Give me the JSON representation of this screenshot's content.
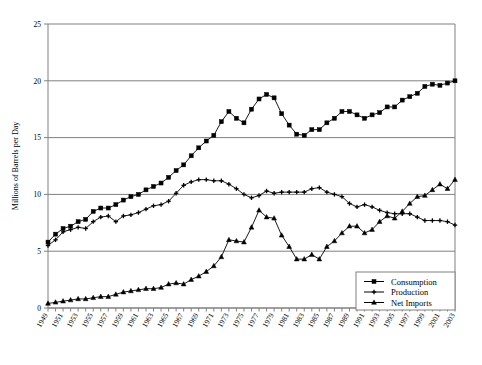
{
  "chart_data": {
    "type": "line",
    "title": "",
    "xlabel": "",
    "ylabel": "Millions of Barrels per Day",
    "ylim": [
      0,
      25
    ],
    "yticks": [
      0,
      5,
      10,
      15,
      20,
      25
    ],
    "ytick_labels": [
      "0",
      "5",
      "10",
      "15",
      "20",
      "25"
    ],
    "grid": true,
    "grid_axis": "y",
    "legend_position": "bottom-right",
    "x": [
      1949,
      1950,
      1951,
      1952,
      1953,
      1954,
      1955,
      1956,
      1957,
      1958,
      1959,
      1960,
      1961,
      1962,
      1963,
      1964,
      1965,
      1966,
      1967,
      1968,
      1969,
      1970,
      1971,
      1972,
      1973,
      1974,
      1975,
      1976,
      1977,
      1978,
      1979,
      1980,
      1981,
      1982,
      1983,
      1984,
      1985,
      1986,
      1987,
      1988,
      1989,
      1990,
      1991,
      1992,
      1993,
      1994,
      1995,
      1996,
      1997,
      1998,
      1999,
      2000,
      2001,
      2002,
      2003
    ],
    "xtick_labels": [
      "1949",
      "1951",
      "1953",
      "1955",
      "1957",
      "1959",
      "1961",
      "1963",
      "1965",
      "1967",
      "1969",
      "1971",
      "1973",
      "1975",
      "1977",
      "1979",
      "1981",
      "1983",
      "1985",
      "1987",
      "1989",
      "1991",
      "1993",
      "1995",
      "1997",
      "1999",
      "2001",
      "2003"
    ],
    "xtick_step": 2,
    "series": [
      {
        "name": "Consumption",
        "marker": "square",
        "color": "#000000",
        "values": [
          5.8,
          6.5,
          7.0,
          7.2,
          7.6,
          7.8,
          8.5,
          8.8,
          8.8,
          9.1,
          9.5,
          9.8,
          10.0,
          10.4,
          10.7,
          11.0,
          11.5,
          12.1,
          12.6,
          13.4,
          14.1,
          14.7,
          15.2,
          16.4,
          17.3,
          16.7,
          16.3,
          17.5,
          18.4,
          18.8,
          18.5,
          17.1,
          16.1,
          15.3,
          15.2,
          15.7,
          15.7,
          16.3,
          16.7,
          17.3,
          17.3,
          17.0,
          16.7,
          17.0,
          17.2,
          17.7,
          17.7,
          18.3,
          18.6,
          18.9,
          19.5,
          19.7,
          19.6,
          19.8,
          20.0
        ]
      },
      {
        "name": "Production",
        "marker": "plus",
        "color": "#000000",
        "values": [
          5.5,
          6.0,
          6.7,
          6.9,
          7.1,
          7.0,
          7.6,
          8.0,
          8.1,
          7.6,
          8.1,
          8.2,
          8.4,
          8.7,
          9.0,
          9.1,
          9.4,
          10.1,
          10.8,
          11.1,
          11.3,
          11.3,
          11.2,
          11.2,
          10.9,
          10.5,
          10.0,
          9.7,
          9.9,
          10.3,
          10.1,
          10.2,
          10.2,
          10.2,
          10.2,
          10.5,
          10.6,
          10.2,
          10.0,
          9.8,
          9.2,
          8.9,
          9.1,
          8.9,
          8.6,
          8.4,
          8.3,
          8.3,
          8.3,
          8.0,
          7.7,
          7.7,
          7.7,
          7.6,
          7.3
        ]
      },
      {
        "name": "Net Imports",
        "marker": "triangle",
        "color": "#000000",
        "values": [
          0.4,
          0.5,
          0.6,
          0.7,
          0.8,
          0.8,
          0.9,
          1.0,
          1.0,
          1.2,
          1.4,
          1.5,
          1.6,
          1.7,
          1.7,
          1.8,
          2.1,
          2.2,
          2.1,
          2.5,
          2.8,
          3.2,
          3.7,
          4.5,
          6.0,
          5.9,
          5.8,
          7.1,
          8.6,
          8.0,
          7.9,
          6.4,
          5.4,
          4.3,
          4.3,
          4.7,
          4.3,
          5.4,
          5.9,
          6.6,
          7.2,
          7.2,
          6.6,
          6.9,
          7.6,
          8.1,
          7.9,
          8.5,
          9.2,
          9.8,
          9.9,
          10.4,
          10.9,
          10.5,
          11.3
        ]
      }
    ]
  }
}
